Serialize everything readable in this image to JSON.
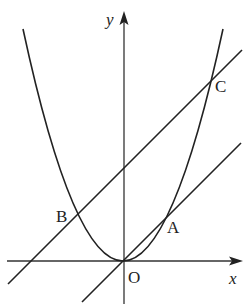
{
  "diagram": {
    "type": "coordinate-geometry",
    "axes": {
      "x_label": "x",
      "y_label": "y",
      "origin_label": "O"
    },
    "points": [
      {
        "label": "A",
        "role": "intersection of line through O with parabola"
      },
      {
        "label": "B",
        "role": "left intersection of upper line with parabola"
      },
      {
        "label": "C",
        "role": "right intersection of upper line with parabola"
      },
      {
        "label": "O",
        "role": "origin"
      }
    ],
    "curves": [
      {
        "name": "parabola",
        "kind": "y = a x^2",
        "vertex": "O"
      },
      {
        "name": "line-OA",
        "kind": "line through origin",
        "slope_sign": "positive"
      },
      {
        "name": "line-BC",
        "kind": "line parallel to OA",
        "slope_sign": "positive"
      }
    ],
    "colors": {
      "stroke": "#222222",
      "background": "#ffffff"
    }
  }
}
